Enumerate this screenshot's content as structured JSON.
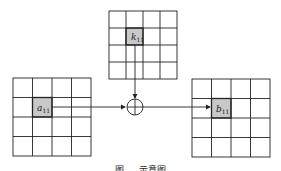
{
  "diagram": {
    "colors": {
      "line": "#222222",
      "highlight": "#c8c8c8",
      "background": "#ffffff"
    },
    "grids": [
      {
        "id": "key",
        "x": 109,
        "y": 11,
        "size": 68,
        "rows": 4,
        "cols": 4,
        "highlight": {
          "row": 1,
          "col": 1
        },
        "label_base": "k",
        "label_sub": "11"
      },
      {
        "id": "input",
        "x": 13,
        "y": 78,
        "size": 78,
        "rows": 4,
        "cols": 4,
        "highlight": {
          "row": 1,
          "col": 1
        },
        "label_base": "a",
        "label_sub": "11"
      },
      {
        "id": "output",
        "x": 192,
        "y": 79,
        "size": 78,
        "rows": 4,
        "cols": 4,
        "highlight": {
          "row": 1,
          "col": 1
        },
        "label_base": "b",
        "label_sub": "11"
      }
    ],
    "operator": {
      "symbol": "xor-circle",
      "cx": 135,
      "cy": 108,
      "r": 8
    },
    "labels": {
      "k": "k",
      "k_sub": "11",
      "a": "a",
      "a_sub": "11",
      "b": "b",
      "b_sub": "11"
    },
    "caption": "图 … 示意图"
  }
}
